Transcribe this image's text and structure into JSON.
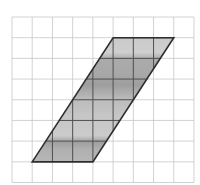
{
  "figure": {
    "canvas": {
      "width": 200,
      "height": 185,
      "background": "#ffffff"
    },
    "grid": {
      "x0": 12,
      "y0": 17,
      "cols": 9,
      "rows": 8,
      "cell_width": 20.22,
      "cell_height": 20.69,
      "line_color": "#c6c6c6",
      "line_width": 0.8
    },
    "parallelogram": {
      "vertices_grid_units": [
        [
          5,
          1
        ],
        [
          8,
          1
        ],
        [
          4,
          7
        ],
        [
          1,
          7
        ]
      ],
      "base_cells": 3,
      "height_cells": 6,
      "stroke_color": "#2e2e2e",
      "stroke_width": 1.6,
      "inner_grid_color": "#4f4f4f",
      "inner_grid_width": 1,
      "fill_bands": [
        {
          "offset": 0.0,
          "color": "#cacaca"
        },
        {
          "offset": 0.12,
          "color": "#cfcfcf"
        },
        {
          "offset": 0.17,
          "color": "#ababab"
        },
        {
          "offset": 0.3,
          "color": "#a7a7a7"
        },
        {
          "offset": 0.38,
          "color": "#9e9e9e"
        },
        {
          "offset": 0.5,
          "color": "#bcbcbc"
        },
        {
          "offset": 0.63,
          "color": "#c6c6c6"
        },
        {
          "offset": 0.79,
          "color": "#cbcbcb"
        },
        {
          "offset": 0.84,
          "color": "#9f9f9f"
        },
        {
          "offset": 0.9,
          "color": "#b0b0b0"
        },
        {
          "offset": 1.0,
          "color": "#b6b6b6"
        }
      ]
    }
  }
}
